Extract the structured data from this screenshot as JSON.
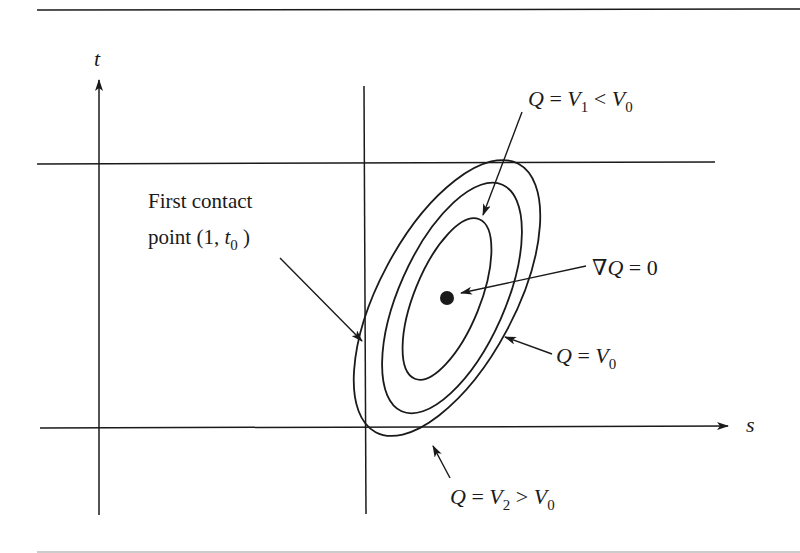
{
  "figure": {
    "axes": {
      "x_label": "s",
      "y_label": "t"
    },
    "labels": {
      "first_contact_line1": "First contact",
      "first_contact_line2_prefix": "point (1, ",
      "first_contact_var": "t",
      "first_contact_sub": "0",
      "first_contact_suffix": " )",
      "gradient_zero_nabla": "∇",
      "gradient_zero_Q": "Q",
      "gradient_zero_rest": " = 0",
      "v1": {
        "Q": "Q",
        "eq": " = ",
        "V": "V",
        "sub": "1",
        "rel": " < ",
        "V0": "V",
        "sub0": "0"
      },
      "v0": {
        "Q": "Q",
        "eq": " = ",
        "V": "V",
        "sub": "0"
      },
      "v2": {
        "Q": "Q",
        "eq": " = ",
        "V": "V",
        "sub": "2",
        "rel": " > ",
        "V0": "V",
        "sub0": "0"
      }
    },
    "elements": {
      "vertical_line_at_s1": "s = 1",
      "horizontal_line_top": "upper t bound",
      "center_point": "minimum of Q (∇Q = 0)",
      "contours": [
        "Q = V1 < V0 (inner)",
        "Q = V0 (middle)",
        "Q = V2 > V0 (outer)"
      ]
    },
    "colors": {
      "ink": "#1a1a1a",
      "background": "#ffffff"
    }
  }
}
